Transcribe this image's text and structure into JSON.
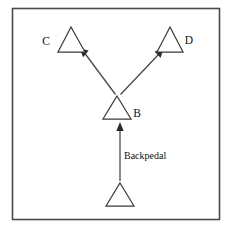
{
  "figure": {
    "kind": "flow-diagram",
    "background_color": "#ffffff",
    "border_color": "#4a4a4a",
    "line_color": "#4a4a4a",
    "shape_color": "#3a3a3a",
    "arrow_fill": "#2a2a2a"
  },
  "labels": {
    "c": "C",
    "d": "D",
    "b": "B",
    "backpedal": "Backpedal"
  },
  "nodes": [
    {
      "id": "start",
      "label": "",
      "apex_x": 120,
      "apex_y": 183,
      "base_left_x": 106,
      "base_right_x": 134,
      "base_y": 206
    },
    {
      "id": "b",
      "label": "B",
      "apex_x": 117,
      "apex_y": 96,
      "base_left_x": 103,
      "base_right_x": 131,
      "base_y": 119
    },
    {
      "id": "c",
      "label": "C",
      "apex_x": 71,
      "apex_y": 27,
      "base_left_x": 58,
      "base_right_x": 85,
      "base_y": 52
    },
    {
      "id": "d",
      "label": "D",
      "apex_x": 170,
      "apex_y": 27,
      "base_left_x": 157,
      "base_right_x": 183,
      "base_y": 52
    }
  ],
  "edges": [
    {
      "id": "backpedal-edge",
      "from": "start",
      "to": "b",
      "label": "Backpedal",
      "x1": 120,
      "y1": 180,
      "x2": 120,
      "y2": 124
    },
    {
      "id": "b-to-c-edge",
      "from": "b",
      "to": "c",
      "label": "",
      "x1": 116,
      "y1": 95,
      "x2": 84,
      "y2": 52
    },
    {
      "id": "b-to-d-edge",
      "from": "b",
      "to": "d",
      "label": "",
      "x1": 120,
      "y1": 95,
      "x2": 157,
      "y2": 52
    }
  ]
}
